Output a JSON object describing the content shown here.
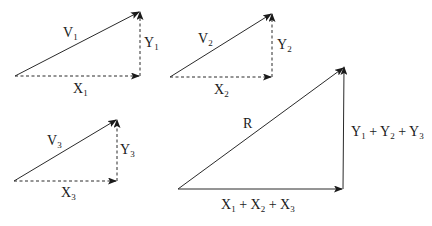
{
  "diagram": {
    "triangles": [
      {
        "id": 1,
        "vector": {
          "name": "V",
          "sub": "1"
        },
        "x_component": {
          "name": "X",
          "sub": "1"
        },
        "y_component": {
          "name": "Y",
          "sub": "1"
        }
      },
      {
        "id": 2,
        "vector": {
          "name": "V",
          "sub": "2"
        },
        "x_component": {
          "name": "X",
          "sub": "2"
        },
        "y_component": {
          "name": "Y",
          "sub": "2"
        }
      },
      {
        "id": 3,
        "vector": {
          "name": "V",
          "sub": "3"
        },
        "x_component": {
          "name": "X",
          "sub": "3"
        },
        "y_component": {
          "name": "Y",
          "sub": "3"
        }
      }
    ],
    "resultant": {
      "vector": {
        "name": "R"
      },
      "x_sum": {
        "terms": [
          {
            "name": "X",
            "sub": "1"
          },
          {
            "name": "X",
            "sub": "2"
          },
          {
            "name": "X",
            "sub": "3"
          }
        ],
        "op": "+"
      },
      "y_sum": {
        "terms": [
          {
            "name": "Y",
            "sub": "1"
          },
          {
            "name": "Y",
            "sub": "2"
          },
          {
            "name": "Y",
            "sub": "3"
          }
        ],
        "op": "+"
      }
    },
    "colors": {
      "line": "#2a2a2a",
      "text": "#1a1a1a",
      "background": "#ffffff"
    }
  }
}
